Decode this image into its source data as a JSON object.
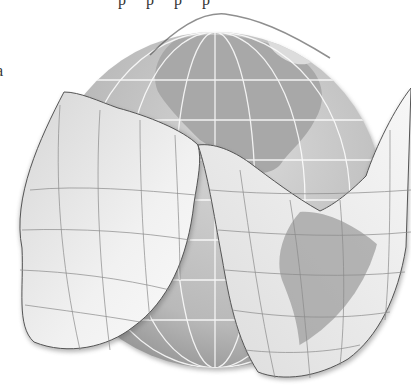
{
  "figure": {
    "top_text_fragment": "p p p p",
    "left_text_fragment": "a",
    "regions": [
      "North America",
      "Central America",
      "South America",
      "Greenland"
    ],
    "colors": {
      "ocean": "#c9c9c9",
      "land": "#a9a9a9",
      "land_light": "#dedede",
      "sphere_shadow": "#8f8f8f",
      "peel_surface": "#eeeeee",
      "graticule_light": "#ffffff",
      "graticule_dark": "#7a7a7a"
    }
  }
}
